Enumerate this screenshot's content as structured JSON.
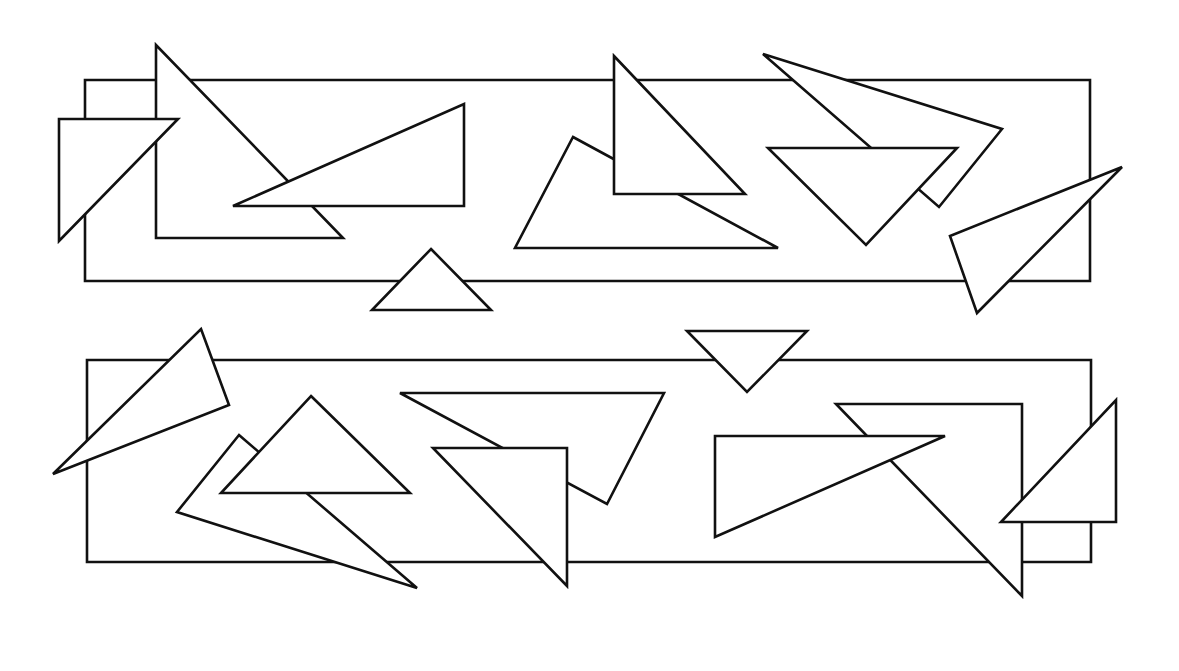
{
  "figure": {
    "width": 1179,
    "height": 671,
    "background": "#ffffff",
    "stroke_color": "#111111",
    "fill_color": "#ffffff"
  },
  "panels": [
    {
      "name": "top-panel",
      "shapes": [
        {
          "name": "top-rectangle",
          "type": "polygon",
          "points": [
            [
              85,
              80
            ],
            [
              1090,
              80
            ],
            [
              1090,
              281
            ],
            [
              85,
              281
            ]
          ]
        },
        {
          "name": "tall-right-triangle",
          "type": "polygon",
          "points": [
            [
              156,
              45
            ],
            [
              156,
              238
            ],
            [
              343,
              238
            ]
          ]
        },
        {
          "name": "left-triangle",
          "type": "polygon",
          "points": [
            [
              59,
              119
            ],
            [
              178,
              119
            ],
            [
              59,
              241
            ]
          ]
        },
        {
          "name": "long-flat-triangle",
          "type": "polygon",
          "points": [
            [
              464,
              104
            ],
            [
              464,
              206
            ],
            [
              233,
              206
            ]
          ]
        },
        {
          "name": "small-upright-triangle",
          "type": "polygon",
          "points": [
            [
              431,
              249
            ],
            [
              491,
              310
            ],
            [
              372,
              310
            ]
          ]
        },
        {
          "name": "wide-back-triangle",
          "type": "polygon",
          "points": [
            [
              573,
              137
            ],
            [
              778,
              248
            ],
            [
              515,
              248
            ]
          ]
        },
        {
          "name": "vertical-right-triangle",
          "type": "polygon",
          "points": [
            [
              614,
              56
            ],
            [
              745,
              194
            ],
            [
              614,
              194
            ]
          ]
        },
        {
          "name": "slanted-kite-triangle",
          "type": "polygon",
          "points": [
            [
              763,
              54
            ],
            [
              1002,
              129
            ],
            [
              939,
              207
            ]
          ]
        },
        {
          "name": "inverted-triangle",
          "type": "polygon",
          "points": [
            [
              768,
              148
            ],
            [
              957,
              148
            ],
            [
              866,
              245
            ]
          ]
        },
        {
          "name": "far-right-sliver-triangle",
          "type": "polygon",
          "points": [
            [
              1122,
              167
            ],
            [
              950,
              236
            ],
            [
              977,
              313
            ]
          ]
        }
      ]
    },
    {
      "name": "bottom-panel",
      "shapes": [
        {
          "name": "bottom-rectangle",
          "type": "polygon",
          "points": [
            [
              87,
              360
            ],
            [
              1091,
              360
            ],
            [
              1091,
              562
            ],
            [
              87,
              562
            ]
          ]
        },
        {
          "name": "inverted-small-triangle",
          "type": "polygon",
          "points": [
            [
              687,
              331
            ],
            [
              807,
              331
            ],
            [
              747,
              392
            ]
          ]
        },
        {
          "name": "left-sliver-triangle",
          "type": "polygon",
          "points": [
            [
              201,
              329
            ],
            [
              229,
              405
            ],
            [
              53,
              474
            ]
          ]
        },
        {
          "name": "long-diagonal-triangle",
          "type": "polygon",
          "points": [
            [
              239,
              435
            ],
            [
              417,
              588
            ],
            [
              177,
              512
            ]
          ]
        },
        {
          "name": "upright-triangle",
          "type": "polygon",
          "points": [
            [
              311,
              396
            ],
            [
              410,
              493
            ],
            [
              221,
              493
            ]
          ]
        },
        {
          "name": "wide-upper-triangle",
          "type": "polygon",
          "points": [
            [
              400,
              393
            ],
            [
              664,
              393
            ],
            [
              607,
              504
            ]
          ]
        },
        {
          "name": "front-right-triangle",
          "type": "polygon",
          "points": [
            [
              433,
              448
            ],
            [
              567,
              448
            ],
            [
              567,
              586
            ]
          ]
        },
        {
          "name": "big-descending-triangle",
          "type": "polygon",
          "points": [
            [
              836,
              404
            ],
            [
              1022,
              404
            ],
            [
              1022,
              596
            ]
          ]
        },
        {
          "name": "flat-wedge-triangle",
          "type": "polygon",
          "points": [
            [
              715,
              436
            ],
            [
              945,
              436
            ],
            [
              715,
              537
            ]
          ]
        },
        {
          "name": "edge-right-triangle",
          "type": "polygon",
          "points": [
            [
              1116,
              400
            ],
            [
              1116,
              522
            ],
            [
              1001,
              522
            ]
          ]
        }
      ]
    }
  ]
}
